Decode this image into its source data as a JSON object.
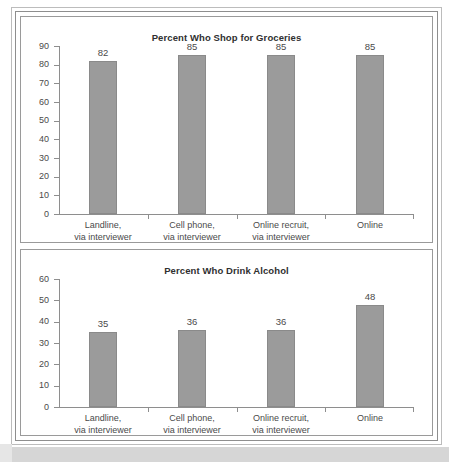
{
  "page": {
    "background_color": "#ffffff",
    "frame_color": "#8e8e8e",
    "bar_color": "#9b9b9b",
    "text_color": "#4a4a4a"
  },
  "charts": [
    {
      "id": "groceries",
      "title": "Percent Who Shop for Groceries",
      "categories": [
        {
          "line1": "Landline,",
          "line2": "via interviewer"
        },
        {
          "line1": "Cell phone,",
          "line2": "via interviewer"
        },
        {
          "line1": "Online recruit,",
          "line2": "via interviewer"
        },
        {
          "line1": "Online",
          "line2": ""
        }
      ],
      "values": [
        82,
        85,
        85,
        85
      ],
      "y_ticks": [
        0,
        10,
        20,
        30,
        40,
        50,
        60,
        70,
        80,
        90
      ]
    },
    {
      "id": "alcohol",
      "title": "Percent Who Drink Alcohol",
      "categories": [
        {
          "line1": "Landline,",
          "line2": "via interviewer"
        },
        {
          "line1": "Cell phone,",
          "line2": "via interviewer"
        },
        {
          "line1": "Online recruit,",
          "line2": "via interviewer"
        },
        {
          "line1": "Online",
          "line2": ""
        }
      ],
      "values": [
        35,
        36,
        36,
        48
      ],
      "y_ticks": [
        0,
        10,
        20,
        30,
        40,
        50,
        60
      ]
    }
  ],
  "chart_data": [
    {
      "type": "bar",
      "title": "Percent Who Shop for Groceries",
      "categories": [
        "Landline, via interviewer",
        "Cell phone, via interviewer",
        "Online recruit, via interviewer",
        "Online"
      ],
      "values": [
        82,
        85,
        85,
        85
      ],
      "data_labels": [
        "82",
        "85",
        "85",
        "85"
      ],
      "xlabel": "",
      "ylabel": "",
      "ylim": [
        0,
        90
      ],
      "ytick_step": 10,
      "yticks": [
        0,
        10,
        20,
        30,
        40,
        50,
        60,
        70,
        80,
        90
      ],
      "grid": false,
      "legend": null,
      "bar_color": "#9b9b9b"
    },
    {
      "type": "bar",
      "title": "Percent Who Drink Alcohol",
      "categories": [
        "Landline, via interviewer",
        "Cell phone, via interviewer",
        "Online recruit, via interviewer",
        "Online"
      ],
      "values": [
        35,
        36,
        36,
        48
      ],
      "data_labels": [
        "35",
        "36",
        "36",
        "48"
      ],
      "xlabel": "",
      "ylabel": "",
      "ylim": [
        0,
        60
      ],
      "ytick_step": 10,
      "yticks": [
        0,
        10,
        20,
        30,
        40,
        50,
        60
      ],
      "grid": false,
      "legend": null,
      "bar_color": "#9b9b9b"
    }
  ]
}
